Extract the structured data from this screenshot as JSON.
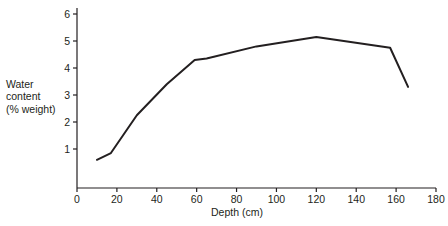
{
  "chart_data": {
    "type": "line",
    "title": "",
    "xlabel": "Depth (cm)",
    "ylabel": "Water content\n(% weight)",
    "ylabel_lines": [
      "Water",
      "content",
      "(% weight)"
    ],
    "xlim": [
      0,
      180
    ],
    "ylim": [
      0,
      6
    ],
    "xticks": [
      0,
      20,
      40,
      60,
      80,
      100,
      120,
      140,
      160,
      180
    ],
    "xtick_labels": [
      "0",
      "20",
      "40",
      "60",
      "80",
      "100",
      "120",
      "140",
      "160",
      "180"
    ],
    "yticks": [
      1,
      2,
      3,
      4,
      5,
      6
    ],
    "ytick_labels": [
      "1",
      "2",
      "3",
      "4",
      "5",
      "6"
    ],
    "grid": false,
    "legend": false,
    "line_color": "#231f20",
    "line_width": 2,
    "x": [
      10,
      17,
      30,
      45,
      59,
      65,
      90,
      120,
      157,
      166
    ],
    "values": [
      0.6,
      0.85,
      2.25,
      3.4,
      4.3,
      4.35,
      4.8,
      5.15,
      4.75,
      3.3
    ],
    "series": [
      {
        "name": "Water content",
        "points": [
          [
            10,
            0.6
          ],
          [
            17,
            0.85
          ],
          [
            30,
            2.25
          ],
          [
            45,
            3.4
          ],
          [
            59,
            4.3
          ],
          [
            65,
            4.35
          ],
          [
            90,
            4.8
          ],
          [
            120,
            5.15
          ],
          [
            157,
            4.75
          ],
          [
            166,
            3.3
          ]
        ]
      }
    ]
  }
}
